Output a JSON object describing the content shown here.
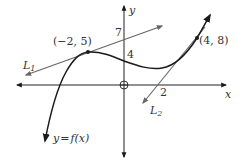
{
  "diagram": {
    "type": "function-graph-with-tangent-lines",
    "colors": {
      "axes": "#222222",
      "curve": "#1a1a1a",
      "tangent_lines": "#666666",
      "text": "#333333"
    },
    "axes": {
      "x_label": "x",
      "y_label": "y"
    },
    "curve": {
      "label": "y = f(x)",
      "label_lhs": "y",
      "label_eq": "=",
      "label_rhs": "f(x)"
    },
    "points": [
      {
        "label": "(−2, 5)",
        "x": -2,
        "y": 5
      },
      {
        "label": "(4, 8)",
        "x": 4,
        "y": 8
      }
    ],
    "lines": [
      {
        "name": "L1",
        "label_main": "L",
        "label_sub": "1",
        "y_intercept_label": "7"
      },
      {
        "name": "L2",
        "label_main": "L",
        "label_sub": "2",
        "x_intercept_label": "2"
      }
    ],
    "annotations": {
      "curve_y_intercept": "4",
      "line1_y_intercept": "7",
      "line2_x_intercept": "2"
    }
  }
}
